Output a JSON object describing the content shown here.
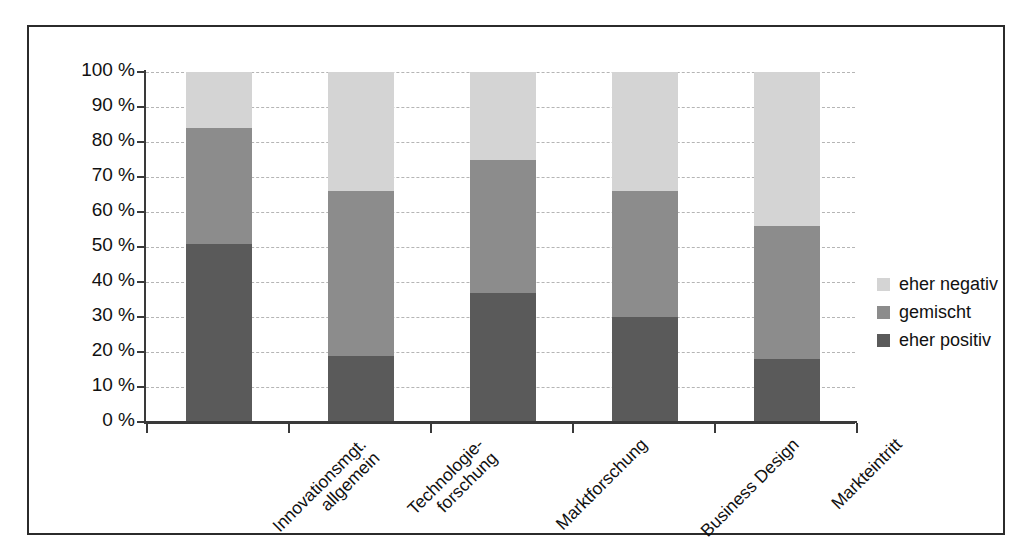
{
  "chart_data": {
    "type": "bar",
    "subtype": "stacked-100-percent",
    "title": "",
    "xlabel": "",
    "ylabel": "",
    "ylim": [
      0,
      100
    ],
    "grid": true,
    "legend_position": "right",
    "categories": [
      "Innovationsmgt. allgemein",
      "Technologie- forschung",
      "Marktforschung",
      "Business Design",
      "Markteintritt"
    ],
    "category_lines": [
      [
        "Innovationsmgt.",
        "allgemein"
      ],
      [
        "Technologie-",
        "forschung"
      ],
      [
        "Marktforschung"
      ],
      [
        "Business Design"
      ],
      [
        "Markteintritt"
      ]
    ],
    "series": [
      {
        "name": "eher positiv",
        "color": "#5a5a5a",
        "values": [
          51,
          19,
          37,
          30,
          18
        ]
      },
      {
        "name": "gemischt",
        "color": "#8c8c8c",
        "values": [
          33,
          47,
          38,
          36,
          38
        ]
      },
      {
        "name": "eher negativ",
        "color": "#d4d4d4",
        "values": [
          16,
          34,
          25,
          34,
          44
        ]
      }
    ],
    "ytick_labels": [
      "100 %",
      "90 %",
      "80 %",
      "70 %",
      "60 %",
      "50 %",
      "40 %",
      "30 %",
      "20 %",
      "10 %",
      "0 %"
    ],
    "ytick_values": [
      100,
      90,
      80,
      70,
      60,
      50,
      40,
      30,
      20,
      10,
      0
    ]
  },
  "legend": {
    "items": [
      {
        "label": "eher negativ",
        "color": "#d4d4d4"
      },
      {
        "label": "gemischt",
        "color": "#8c8c8c"
      },
      {
        "label": "eher positiv",
        "color": "#5a5a5a"
      }
    ]
  },
  "colors": {
    "negativ": "#d4d4d4",
    "gemischt": "#8c8c8c",
    "positiv": "#5a5a5a",
    "axis": "#3a3a3a",
    "grid": "#b5b5b5",
    "frame": "#2b2b2b",
    "background": "#ffffff"
  }
}
